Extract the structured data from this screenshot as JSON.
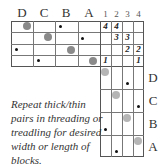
{
  "threading_labels": [
    "D",
    "C",
    "B",
    "A"
  ],
  "tieup_labels": [
    "1",
    "2",
    "3",
    "4"
  ],
  "treadling_labels": [
    "D",
    "C",
    "B",
    "A"
  ],
  "tieup": {
    "r0c0": "4",
    "r0c1": "4",
    "r1c1": "3",
    "r1c2": "3",
    "r2c2": "2",
    "r2c3": "2",
    "r3c0": "1",
    "r3c3": "1"
  },
  "note": "Repeat thick/thin pairs in threading or treadling for desired width or length of blocks."
}
